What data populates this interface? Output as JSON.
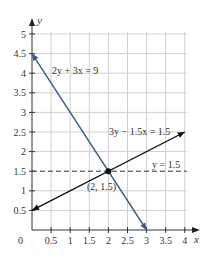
{
  "chart_data": {
    "type": "line",
    "title": "",
    "xlabel": "x",
    "ylabel": "y",
    "xlim": [
      0,
      4
    ],
    "ylim": [
      0,
      5
    ],
    "grid": true,
    "x_ticks": [
      "0.5",
      "1",
      "1.5",
      "2",
      "2.5",
      "3",
      "3.5",
      "4"
    ],
    "y_ticks": [
      "0.5",
      "1",
      "1.5",
      "2",
      "2.5",
      "3",
      "3.5",
      "4",
      "4.5",
      "5"
    ],
    "origin_label": "0",
    "series": [
      {
        "name": "2y + 3x = 9",
        "label": "2y + 3x = 9",
        "color": "#3d5a8a",
        "style": "solid",
        "points": [
          [
            0,
            4.5
          ],
          [
            3,
            0
          ]
        ]
      },
      {
        "name": "3y − 1.5x = 1.5",
        "label": "3y − 1.5x = 1.5",
        "color": "#111111",
        "style": "solid",
        "points": [
          [
            0,
            0.5
          ],
          [
            4,
            2.5
          ]
        ]
      },
      {
        "name": "y = 1.5",
        "label": "y = 1.5",
        "color": "#333333",
        "style": "dashed",
        "points": [
          [
            0,
            1.5
          ],
          [
            4,
            1.5
          ]
        ]
      }
    ],
    "annotations": [
      {
        "text": "(2, 1.5)",
        "x": 2,
        "y": 1.5,
        "type": "point"
      }
    ]
  }
}
